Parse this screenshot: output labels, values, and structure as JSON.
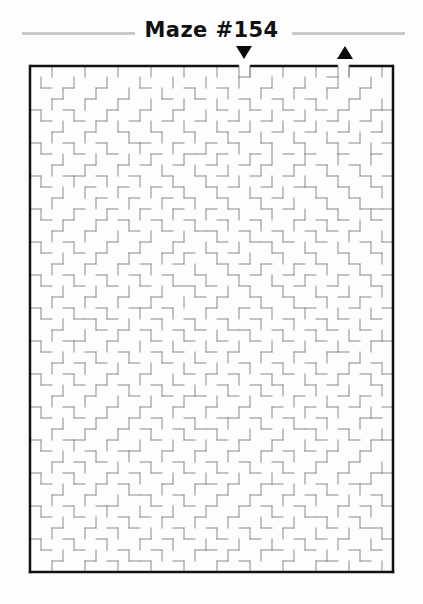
{
  "page": {
    "background_color": "#fdfdfd",
    "width": 423,
    "height": 604
  },
  "header": {
    "title": "Maze #154",
    "rule_color": "#c9c9c9",
    "title_color": "#111111"
  },
  "markers": {
    "entrance": {
      "icon": "down-triangle",
      "label": "Entrance",
      "color": "#0a0a0a",
      "column": 19
    },
    "exit": {
      "icon": "up-triangle",
      "label": "Exit",
      "color": "#0a0a0a",
      "column": 28
    }
  },
  "maze": {
    "columns": 33,
    "rows": 46,
    "cell_size": 11,
    "origin_x": 2,
    "origin_y": 2,
    "border_color": "#111111",
    "border_width": 2.5,
    "wall_color": "#8a8a8a",
    "wall_width": 1,
    "openings": {
      "top": [
        19,
        28
      ]
    },
    "h_walls": [
      "0000000000000000000100000001000",
      "01010010001000100100010010010010",
      "00100100100010010001001001000100",
      "10010001001001000100100100101001",
      "01001010010010010010010010010010",
      "00100100100100100101001001001001",
      "10010010011001001010010010010100",
      "01001001000100110100100101001001",
      "00100100101001001001010010100100",
      "10011010010010010100100100010010",
      "01000100100101001010010011001001",
      "00100010010010100100101000100100",
      "10001001001001001010010100010011",
      "01010010100100100100100010101001",
      "00100100010010011001001001010100",
      "10010001001001000100110100100010",
      "01001010010010101010001001001001",
      "00100100101001000101010010100100",
      "10010010010010010010100101001010",
      "01001001001001101001001010010001",
      "00100100100100010100100100101010",
      "10010010011010001001010011000100",
      "01001101000100100100100100101001",
      "00100010101001010011001001010010",
      "10011001000100100100100100100101",
      "01000100100101001010010010011000",
      "00101010010010010001001001000101",
      "10010001001000101010010100101010",
      "01001010100101000100101001010001",
      "00100100010010110010010010001010",
      "10010001001001001001001001010100",
      "01001010010100100110100100100011",
      "00100100101001011000010011001000",
      "10011001000100100101001000100101",
      "01000100110010010010010101010010",
      "00101010001001001001001000100100",
      "10010001010100100100100101001001",
      "01001010100010011010011000100110",
      "00100100011001000100100101010001",
      "10010011000100101001010010001010",
      "01001000101010010010001001100100",
      "00100101010001001001010100010011",
      "10010010001010100100100010101000",
      "01001000100100011010011001000101",
      "00100101011001000101000100110010"
    ],
    "v_walls": [
      "01001001001001001001001001001001",
      "10010010010010010010010010010010",
      "00100100100100100100100100100100",
      "01001001001001001001001001001001",
      "10010010010010010010010010010010",
      "00100101001001001001001001001001",
      "01001000100100100100100100100100",
      "10010010010010010010010010010010",
      "00100100101001001001010010010010",
      "01001001000100100100100100100100",
      "10010010010010010010010010010010",
      "00101001001001001001001001001001",
      "01000100100100100100100100100100",
      "10010010010010010010010010010010",
      "00100100100100100100100100100100",
      "01001001001001001001001001001001",
      "10010010010010010010010010010010",
      "00100100100101001001001001001001",
      "01001001001000100100100100100100",
      "10010010010010010010010010010010",
      "00100100100100100101001001001001",
      "01001001001001001000100100100100",
      "10010010010010010010010010010010",
      "00100100100100100100100100100100",
      "01001001001001001001001001001001",
      "10010010010010010010010010010010",
      "00100100100100100100100100100100",
      "01001001001001001001001001001001",
      "10010010010010010010010010010010",
      "00100100100100100100101001001001",
      "01001001001001001001000100100100",
      "10010010010010010010010010010010",
      "00100100100100100100100100100100",
      "01001001001001001001001001001001",
      "10010010010010010010010010010010",
      "00100100100100100100100100100100",
      "01001001001001001001001001001001",
      "10010010010010010010010010010010",
      "00100100100100100100100100100100",
      "01001001001001001001001001001001",
      "10010010010010010010010010010010",
      "00100100100100100100100100100100",
      "01001001001001001001001001001001",
      "10010010010010010010010010010010",
      "00100100100100100100100100100100",
      "01001001001001001001001001001001"
    ]
  }
}
